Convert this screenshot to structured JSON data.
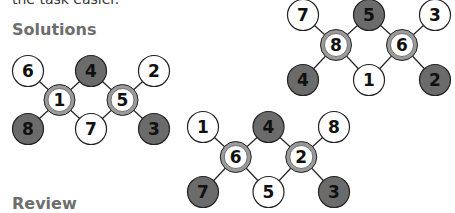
{
  "intro_text": "the task easier.",
  "headings": {
    "solutions": "Solutions",
    "review": "Review"
  },
  "colors": {
    "dark_node": "#6b6b6b",
    "light_node": "#ffffff",
    "ring": "#9a9a9a",
    "stroke": "#222222",
    "heading": "#6d6d6d"
  },
  "diagrams": [
    {
      "name": "solution-1",
      "top": [
        {
          "v": "6",
          "type": "light"
        },
        {
          "v": "4",
          "type": "dark"
        },
        {
          "v": "2",
          "type": "light"
        }
      ],
      "middle": [
        {
          "v": "1",
          "type": "ring"
        },
        {
          "v": "5",
          "type": "ring"
        }
      ],
      "bottom": [
        {
          "v": "8",
          "type": "dark"
        },
        {
          "v": "7",
          "type": "light"
        },
        {
          "v": "3",
          "type": "dark"
        }
      ]
    },
    {
      "name": "solution-2",
      "top": [
        {
          "v": "7",
          "type": "light"
        },
        {
          "v": "5",
          "type": "dark"
        },
        {
          "v": "3",
          "type": "light"
        }
      ],
      "middle": [
        {
          "v": "8",
          "type": "ring"
        },
        {
          "v": "6",
          "type": "ring"
        }
      ],
      "bottom": [
        {
          "v": "4",
          "type": "dark"
        },
        {
          "v": "1",
          "type": "light"
        },
        {
          "v": "2",
          "type": "dark"
        }
      ]
    },
    {
      "name": "solution-3",
      "top": [
        {
          "v": "1",
          "type": "light"
        },
        {
          "v": "4",
          "type": "dark"
        },
        {
          "v": "8",
          "type": "light"
        }
      ],
      "middle": [
        {
          "v": "6",
          "type": "ring"
        },
        {
          "v": "2",
          "type": "ring"
        }
      ],
      "bottom": [
        {
          "v": "7",
          "type": "dark"
        },
        {
          "v": "5",
          "type": "light"
        },
        {
          "v": "3",
          "type": "dark"
        }
      ]
    }
  ]
}
